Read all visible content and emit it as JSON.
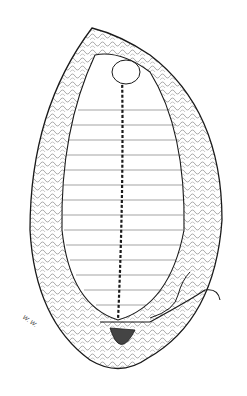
{
  "illustration": {
    "subject": "surgical anatomical line drawing",
    "style": "black ink on white",
    "colors": {
      "ink": "#1a1a1a",
      "background": "#ffffff"
    },
    "signature": "W. W."
  }
}
